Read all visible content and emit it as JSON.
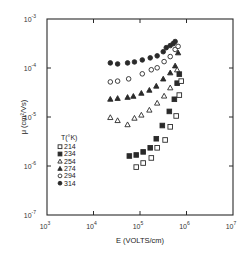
{
  "chart_data": {
    "type": "scatter",
    "title": "",
    "xlabel": "E (VOLTS/cm)",
    "ylabel": "μ (cm²/Vs)",
    "xscale": "log",
    "yscale": "log",
    "xlim": [
      1000,
      10000000
    ],
    "ylim": [
      1e-07,
      0.001
    ],
    "grid": false,
    "x_ticks": [
      {
        "value": 1000,
        "base": "10",
        "exp": "3"
      },
      {
        "value": 10000,
        "base": "10",
        "exp": "4"
      },
      {
        "value": 100000,
        "base": "10",
        "exp": "5"
      },
      {
        "value": 1000000,
        "base": "10",
        "exp": "6"
      },
      {
        "value": 10000000,
        "base": "10",
        "exp": "7"
      }
    ],
    "y_ticks": [
      {
        "value": 1e-07,
        "base": "10",
        "exp": "-7"
      },
      {
        "value": 1e-06,
        "base": "10",
        "exp": "-6"
      },
      {
        "value": 1e-05,
        "base": "10",
        "exp": "-5"
      },
      {
        "value": 0.0001,
        "base": "10",
        "exp": "-4"
      },
      {
        "value": 0.001,
        "base": "10",
        "exp": "-3"
      }
    ],
    "legend": {
      "title": "T(°K)",
      "position": "inside-left-lower",
      "entries": [
        {
          "label": "214",
          "marker": "square-open"
        },
        {
          "label": "234",
          "marker": "square-filled"
        },
        {
          "label": "254",
          "marker": "triangle-open"
        },
        {
          "label": "274",
          "marker": "triangle-filled"
        },
        {
          "label": "294",
          "marker": "circle-open"
        },
        {
          "label": "314",
          "marker": "circle-filled"
        }
      ]
    },
    "series": [
      {
        "name": "314",
        "marker": "circle-filled",
        "x": [
          23000,
          33000,
          54000,
          76000,
          112000,
          166000,
          234000,
          316000,
          367000,
          447000,
          518000,
          570000
        ],
        "y": [
          0.000127,
          0.000121,
          0.000127,
          0.000133,
          0.000146,
          0.000161,
          0.000177,
          0.000215,
          0.00026,
          0.000287,
          0.000315,
          0.000347
        ]
      },
      {
        "name": "294",
        "marker": "circle-open",
        "x": [
          23000,
          33000,
          57000,
          112000,
          175000,
          234000,
          330000,
          447000,
          570000,
          660000
        ],
        "y": [
          5.2e-05,
          5.4e-05,
          6e-05,
          7.6e-05,
          9.2e-05,
          0.000101,
          0.000135,
          0.000171,
          0.000239,
          0.000276
        ]
      },
      {
        "name": "274",
        "marker": "triangle-filled",
        "x": [
          23000,
          33000,
          54000,
          72000,
          107000,
          159000,
          224000,
          316000,
          447000,
          570000,
          660000
        ],
        "y": [
          2.32e-05,
          2.41e-05,
          2.53e-05,
          2.66e-05,
          3.07e-05,
          3.54e-05,
          4.29e-05,
          6e-05,
          8e-05,
          0.000111,
          0.000205
        ]
      },
      {
        "name": "254",
        "marker": "triangle-open",
        "x": [
          23000,
          33000,
          54000,
          76000,
          107000,
          159000,
          234000,
          330000,
          447000,
          630000
        ],
        "y": [
          9.8e-06,
          8.5e-06,
          7e-06,
          9.5e-06,
          1.1e-05,
          1.39e-05,
          1.93e-05,
          2.69e-05,
          3.96e-05,
          9.2e-05
        ]
      },
      {
        "name": "234",
        "marker": "square-filled",
        "x": [
          59000,
          83000,
          117000,
          166000,
          224000,
          302000,
          427000,
          548000,
          630000,
          700000
        ],
        "y": [
          1.6e-06,
          1.68e-06,
          1.94e-06,
          2.35e-06,
          3.6e-06,
          6.7e-06,
          1.3e-05,
          2.3e-05,
          4.9e-05,
          7.5e-05
        ]
      },
      {
        "name": "214",
        "marker": "square-open",
        "x": [
          83000,
          117000,
          175000,
          234000,
          347000,
          447000,
          600000,
          700000,
          770000
        ],
        "y": [
          9.5e-07,
          1.15e-06,
          1.46e-06,
          2.35e-06,
          3.4e-06,
          6.3e-06,
          1.05e-05,
          2.8e-05,
          5.4e-05
        ]
      }
    ]
  }
}
